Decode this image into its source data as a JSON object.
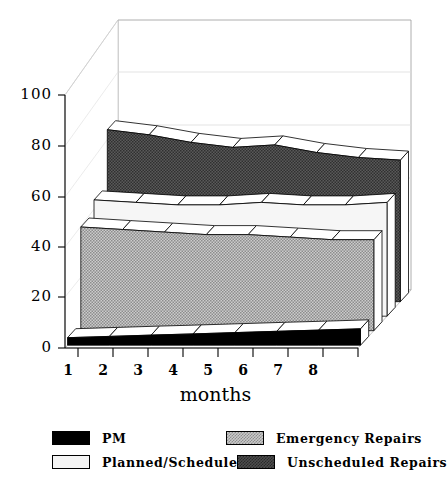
{
  "chart_data": {
    "type": "area",
    "title": "",
    "xlabel": "months",
    "ylabel": "",
    "x": [
      1,
      2,
      3,
      4,
      5,
      6,
      7,
      8
    ],
    "xticklabels": [
      "1",
      "2",
      "3",
      "4",
      "5",
      "6",
      "7",
      "8"
    ],
    "yticklabels": [
      "0",
      "20",
      "40",
      "60",
      "80",
      "100"
    ],
    "yticks": [
      0,
      20,
      40,
      60,
      80,
      100
    ],
    "ylim": [
      0,
      100
    ],
    "grid": true,
    "legend_position": "bottom",
    "projection": "3d-ribbon",
    "series": [
      {
        "name": "Unscheduled Repairs",
        "color": "#4d4d4d",
        "pattern": "dark-checker",
        "depth_index": 0,
        "values": [
          68,
          66,
          63,
          61,
          62,
          59,
          57,
          56
        ]
      },
      {
        "name": "Planned/Scheduled",
        "color": "#f4f4f4",
        "pattern": "solid-light",
        "depth_index": 1,
        "values": [
          46,
          45,
          44,
          44,
          45,
          44,
          44,
          45
        ]
      },
      {
        "name": "Emergency Repairs",
        "color": "#c9c9c9",
        "pattern": "light-checker",
        "depth_index": 2,
        "values": [
          41,
          40,
          39,
          38,
          38,
          37,
          36,
          36
        ]
      },
      {
        "name": "PM",
        "color": "#000000",
        "pattern": "solid-black",
        "depth_index": 3,
        "values": [
          3,
          3.5,
          4,
          4.5,
          5,
          5.5,
          6,
          6.5
        ]
      }
    ]
  },
  "legend": {
    "entries": [
      {
        "label": "PM",
        "swatch": "sw-pm"
      },
      {
        "label": "Emergency Repairs",
        "swatch": "sw-emerg"
      },
      {
        "label": "Planned/Scheduled",
        "swatch": "sw-planned"
      },
      {
        "label": "Unscheduled Repairs",
        "swatch": "sw-unsch"
      }
    ]
  },
  "axes": {
    "x_title": "months",
    "y_labels": [
      "100",
      "80",
      "60",
      "40",
      "20",
      "0"
    ],
    "x_labels": [
      "1",
      "2",
      "3",
      "4",
      "5",
      "6",
      "7",
      "8"
    ]
  }
}
